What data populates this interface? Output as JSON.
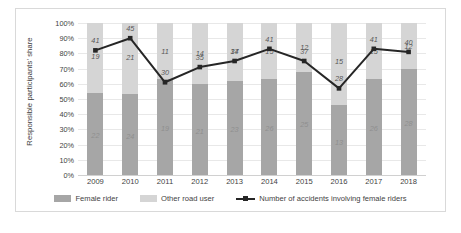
{
  "chart_data": {
    "type": "bar",
    "title": "",
    "xlabel": "",
    "ylabel": "Responsible participants' share",
    "categories": [
      "2009",
      "2010",
      "2011",
      "2012",
      "2013",
      "2014",
      "2015",
      "2016",
      "2017",
      "2018"
    ],
    "ylim": [
      0,
      100
    ],
    "ytick_labels": [
      "0%",
      "10%",
      "20%",
      "30%",
      "40%",
      "50%",
      "60%",
      "70%",
      "80%",
      "90%",
      "100%"
    ],
    "ytick_values": [
      0,
      10,
      20,
      30,
      40,
      50,
      60,
      70,
      80,
      90,
      100
    ],
    "grid": true,
    "stacked": true,
    "legend_position": "bottom",
    "series": [
      {
        "name": "Female rider",
        "type": "bar",
        "color": "#a6a6a6",
        "values": [
          22,
          24,
          19,
          21,
          23,
          26,
          25,
          13,
          26,
          28
        ],
        "share_percent": [
          54,
          53,
          63,
          60,
          62,
          63,
          68,
          46,
          63,
          70
        ]
      },
      {
        "name": "Other road user",
        "type": "bar",
        "color": "#d5d5d5",
        "values": [
          19,
          21,
          11,
          14,
          14,
          15,
          12,
          15,
          15,
          12
        ],
        "share_percent": [
          46,
          47,
          37,
          40,
          38,
          37,
          32,
          54,
          37,
          30
        ]
      },
      {
        "name": "Number of accidents involving female riders",
        "type": "line",
        "color": "#262626",
        "values": [
          41,
          45,
          30,
          35,
          37,
          41,
          37,
          28,
          41,
          40
        ],
        "plot_percent": [
          82,
          90,
          61,
          71,
          75,
          83,
          75,
          57,
          83,
          81
        ]
      }
    ]
  },
  "legend": {
    "items": [
      {
        "label": "Female rider",
        "icon": "square-swatch"
      },
      {
        "label": "Other road user",
        "icon": "square-swatch"
      },
      {
        "label": "Number of accidents involving female riders",
        "icon": "line-marker-swatch"
      }
    ]
  }
}
